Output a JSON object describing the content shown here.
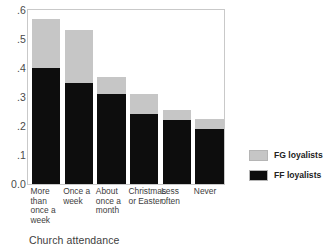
{
  "chart_data": {
    "type": "bar",
    "title": "",
    "subtitle": "",
    "xlabel": "Church attendance",
    "ylabel": "",
    "stacked": true,
    "grid": false,
    "ylim": [
      0.0,
      0.6
    ],
    "yticks": [
      "0.0",
      ".1",
      ".2",
      ".3",
      ".4",
      ".5",
      ".6"
    ],
    "ytick_values": [
      0.0,
      0.1,
      0.2,
      0.3,
      0.4,
      0.5,
      0.6
    ],
    "categories": [
      "More than once a week",
      "Once a week",
      "About once a month",
      "Christmas or Easter",
      "Less often",
      "Never"
    ],
    "category_lines": [
      [
        "More",
        "than",
        "once a",
        "week"
      ],
      [
        "Once a",
        "week"
      ],
      [
        "About",
        "once a",
        "month"
      ],
      [
        "Christmas",
        "or Easter"
      ],
      [
        "Less",
        "often"
      ],
      [
        "Never"
      ]
    ],
    "series": [
      {
        "name": "FF loyalists",
        "color": "#0d0d0d",
        "values": [
          0.4,
          0.35,
          0.31,
          0.24,
          0.22,
          0.19
        ]
      },
      {
        "name": "FG loyalists",
        "color": "#c6c6c6",
        "values": [
          0.17,
          0.18,
          0.06,
          0.07,
          0.035,
          0.035
        ]
      }
    ],
    "totals": [
      0.57,
      0.53,
      0.37,
      0.31,
      0.255,
      0.225
    ],
    "legend_position": "right",
    "legend": [
      {
        "label": "FG loyalists",
        "color": "#c6c6c6"
      },
      {
        "label": "FF loyalists",
        "color": "#0d0d0d"
      }
    ]
  }
}
